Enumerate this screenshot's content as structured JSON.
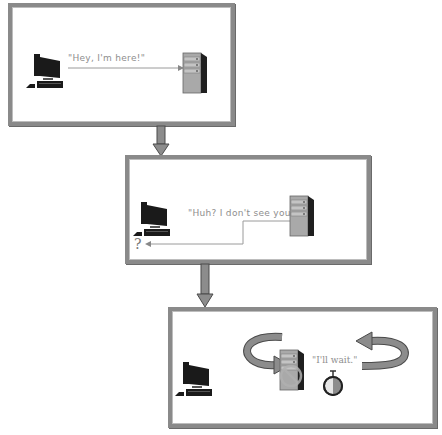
{
  "colors": {
    "frame": "#8a8a8a",
    "arrow_fill": "#8c8c8c",
    "arrow_stroke": "#4a4a4a",
    "line": "#9a9a9a",
    "text": "#8e8e8e",
    "computer": "#1a1a1a",
    "server_body": "#a9a9a9",
    "server_side": "#1f1f1f"
  },
  "panels": [
    {
      "id": "step-1",
      "speech": "\"Hey, I'm here!\"",
      "client_icon": "desktop-computer-icon",
      "server_icon": "server-tower-icon",
      "message_direction": "client-to-server"
    },
    {
      "id": "step-2",
      "speech": "\"Huh? I don't see you.\"",
      "client_icon": "desktop-computer-icon",
      "server_icon": "server-tower-icon",
      "confused_mark": "?",
      "message_direction": "server-to-client"
    },
    {
      "id": "step-3",
      "speech": "\"I'll wait.\"",
      "client_icon": "desktop-computer-icon",
      "server_icon": "server-tower-icon",
      "wait_icons": [
        "circular-arrow-left-icon",
        "stopwatch-icon",
        "circular-arrow-right-icon",
        "no-entry-icon"
      ]
    }
  ],
  "connectors": [
    "down-arrow",
    "down-arrow"
  ]
}
